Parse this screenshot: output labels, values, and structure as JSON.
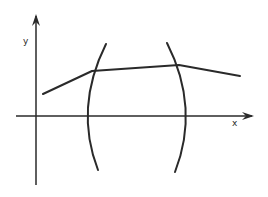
{
  "diagram": {
    "axes": {
      "x_label": "x",
      "y_label": "y",
      "origin": [
        36,
        116
      ],
      "x_arrow_tip": [
        254,
        116
      ],
      "y_arrow_tip": [
        36,
        14
      ],
      "x_start": [
        16,
        116
      ],
      "y_end": [
        36,
        185
      ]
    },
    "polyline": {
      "points": [
        [
          43,
          94
        ],
        [
          92,
          71
        ],
        [
          179,
          65
        ],
        [
          240,
          76
        ]
      ]
    },
    "left_arc": {
      "start": [
        106,
        44
      ],
      "control": [
        74,
        108
      ],
      "end": [
        98,
        170
      ]
    },
    "right_arc": {
      "start": [
        167,
        43
      ],
      "control": [
        200,
        108
      ],
      "end": [
        175,
        172
      ]
    },
    "stroke_color": "#2a2a2a"
  }
}
